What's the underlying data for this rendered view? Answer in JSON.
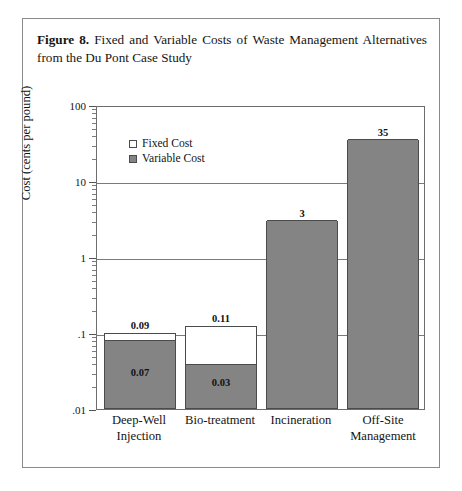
{
  "figure": {
    "number_label": "Figure 8.",
    "caption_text": "Fixed and Variable Costs of Waste Management Alternatives from the Du Pont Case Study"
  },
  "legend": {
    "position": "top-left-inside",
    "items": [
      {
        "label": "Fixed Cost",
        "swatch": "white-square",
        "color": "#ffffff"
      },
      {
        "label": "Variable Cost",
        "swatch": "gray-square",
        "color": "#848484"
      }
    ]
  },
  "chart_data": {
    "type": "bar",
    "stacked": true,
    "title": "Fixed and Variable Costs of Waste Management Alternatives from the Du Pont Case Study",
    "xlabel": "",
    "ylabel": "Cost (cents per pound)",
    "yscale": "log",
    "ylim": [
      0.01,
      100
    ],
    "ytick_labels": [
      "100",
      "10",
      "1",
      ".1",
      ".01"
    ],
    "ytick_values": [
      100,
      10,
      1,
      0.1,
      0.01
    ],
    "grid": "horizontal-major",
    "categories": [
      "Deep-Well Injection",
      "Bio-treatment",
      "Incineration",
      "Off-Site Management"
    ],
    "category_lines": [
      [
        "Deep-Well",
        "Injection"
      ],
      [
        "Bio-treatment",
        ""
      ],
      [
        "Incineration",
        ""
      ],
      [
        "Off-Site",
        "Management"
      ]
    ],
    "series": [
      {
        "name": "Variable Cost",
        "color": "#848484",
        "values": [
          0.07,
          0.03,
          3,
          35
        ]
      },
      {
        "name": "Fixed Cost",
        "color": "#ffffff",
        "values": [
          0.02,
          0.08,
          0,
          0
        ]
      }
    ],
    "totals": [
      0.09,
      0.11,
      3,
      35
    ],
    "total_labels": [
      "0.09",
      "0.11",
      "3",
      "35"
    ],
    "variable_labels": [
      "0.07",
      "0.03",
      "",
      ""
    ]
  }
}
